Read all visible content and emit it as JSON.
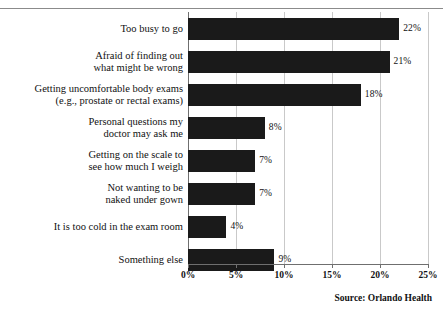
{
  "chart_data": {
    "type": "bar",
    "orientation": "horizontal",
    "title": "",
    "subtitle": "",
    "xlabel": "",
    "ylabel": "",
    "xlim": [
      0,
      25
    ],
    "grid": true,
    "legend": null,
    "source_note": "Source:  Orlando Health",
    "xticks": [
      "0%",
      "5%",
      "10%",
      "15%",
      "20%",
      "25%"
    ],
    "xtick_values": [
      0,
      5,
      10,
      15,
      20,
      25
    ],
    "categories": [
      "Too busy to go",
      "Afraid of finding out\nwhat might be wrong",
      "Getting uncomfortable body exams\n(e.g., prostate or rectal exams)",
      "Personal questions my\ndoctor may ask me",
      "Getting on the scale to\nsee how much I weigh",
      "Not wanting to be\nnaked under gown",
      "It is too cold in the exam room",
      "Something else"
    ],
    "values": [
      22,
      21,
      18,
      8,
      7,
      7,
      4,
      9
    ],
    "value_labels": [
      "22%",
      "21%",
      "18%",
      "8%",
      "7%",
      "7%",
      "4%",
      "9%"
    ],
    "bar_color": "#1a1a1a",
    "grid_color": "#c9c9c9",
    "axis_color": "#6f6f6f",
    "background_color": "#ffffff"
  }
}
